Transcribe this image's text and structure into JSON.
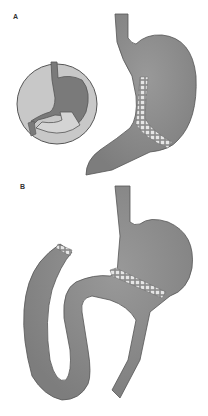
{
  "panels": [
    {
      "label": "A",
      "description": "Sleeve gastrectomy with stapled line along greater curvature; inset circle shows normal stomach"
    },
    {
      "label": "B",
      "description": "Roux-en-Y gastric bypass with small gastric pouch, stapled transection line, and looped intestinal limb with stapled end"
    }
  ],
  "colors": {
    "organ_fill": "#8c8c8c",
    "organ_stroke": "#4a4a4a",
    "inset_bg": "#c8c8c8",
    "inset_organ": "#7a7a7a",
    "staple": "#e6e6e6",
    "background": "#ffffff"
  }
}
